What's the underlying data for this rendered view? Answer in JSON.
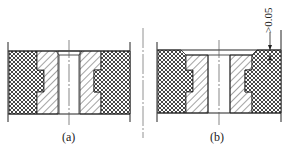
{
  "figure": {
    "type": "technical cross-section drawing",
    "panels": [
      {
        "id": "a",
        "caption": "(a)"
      },
      {
        "id": "b",
        "caption": "(b)",
        "dimension_label": ">0.05"
      }
    ],
    "colors": {
      "line": "#222222",
      "background": "#ffffff",
      "centerline": "#555555"
    }
  }
}
